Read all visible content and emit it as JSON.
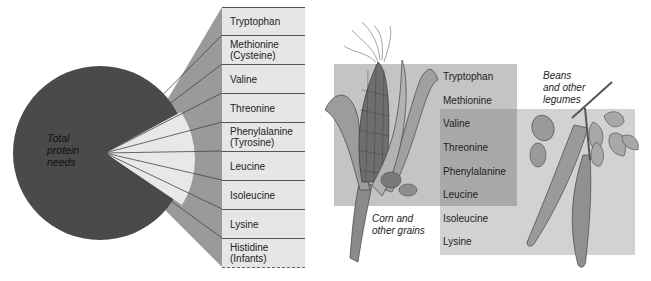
{
  "pie": {
    "label": "Total\nprotein\nneeds",
    "colors": {
      "main": "#4a4a4a",
      "wedge": "#e8e8e8",
      "fan": "#9a9a9a",
      "table_bg": "#e6e6e6"
    }
  },
  "essential_amino_acids": [
    {
      "label": "Tryptophan"
    },
    {
      "label": "Methionine\n(Cysteine)"
    },
    {
      "label": "Valine"
    },
    {
      "label": "Threonine"
    },
    {
      "label": "Phenylalanine\n(Tyrosine)"
    },
    {
      "label": "Leucine"
    },
    {
      "label": "Isoleucine"
    },
    {
      "label": "Lysine"
    },
    {
      "label": "Histidine\n(Infants)"
    }
  ],
  "food_sources": {
    "grains_caption": "Corn and\nother grains",
    "legumes_caption": "Beans\nand other\nlegumes",
    "amino_acids": [
      {
        "label": "Tryptophan",
        "source": "grains"
      },
      {
        "label": "Methionine",
        "source": "grains"
      },
      {
        "label": "Valine",
        "source": "both"
      },
      {
        "label": "Threonine",
        "source": "both"
      },
      {
        "label": "Phenylalanine",
        "source": "both"
      },
      {
        "label": "Leucine",
        "source": "both"
      },
      {
        "label": "Isoleucine",
        "source": "legumes"
      },
      {
        "label": "Lysine",
        "source": "legumes"
      }
    ],
    "colors": {
      "grains_box": "#c4c4c4",
      "legumes_box": "#d2d2d2",
      "overlap": "#a9a9a9"
    }
  }
}
